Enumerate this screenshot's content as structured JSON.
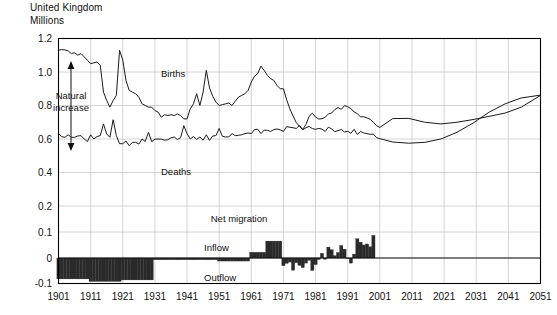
{
  "header": {
    "title": "United Kingdom",
    "units": "Millions"
  },
  "annotations": {
    "natural_increase_line1": "Natural",
    "natural_increase_line2": "increase",
    "births": "Births",
    "deaths": "Deaths",
    "net_migration": "Net migration",
    "inflow": "Inflow",
    "outflow": "Outflow"
  },
  "colors": {
    "line": "#1a1a1a",
    "grid": "#c9c9c9",
    "axis": "#000000",
    "bar": "#2a2a2a",
    "background": "#ffffff"
  },
  "chart_data": {
    "type": "line",
    "title": "United Kingdom",
    "subtitle": "Millions",
    "xlabel": "",
    "ylabel": "Millions",
    "xlim": [
      1901,
      2051
    ],
    "ylim": [
      -0.1,
      1.2
    ],
    "grid": true,
    "legend": "inline-labels",
    "yticks": [
      -0.1,
      0,
      0.1,
      0.2,
      0.4,
      0.6,
      0.8,
      1.0,
      1.2
    ],
    "ytick_labels": [
      "-0.1",
      "0",
      "0.1",
      "0.2",
      "0.4",
      "0.6",
      "0.8",
      "1.0",
      "1.2"
    ],
    "y_axis_note": "non-linear: region below 0.2 is expanded for the migration bars",
    "xticks": [
      1901,
      1911,
      1921,
      1931,
      1941,
      1951,
      1961,
      1971,
      1981,
      1991,
      2001,
      2011,
      2021,
      2031,
      2041,
      2051
    ],
    "xtick_labels": [
      "1901",
      "1911",
      "1921",
      "1931",
      "1941",
      "1951",
      "1961",
      "1971",
      "1981",
      "1991",
      "2001",
      "2011",
      "2021",
      "2031",
      "2041",
      "2051"
    ],
    "series": [
      {
        "name": "Births",
        "x": [
          1901,
          1902,
          1903,
          1904,
          1905,
          1906,
          1907,
          1908,
          1909,
          1910,
          1911,
          1912,
          1913,
          1914,
          1915,
          1916,
          1917,
          1918,
          1919,
          1920,
          1921,
          1922,
          1923,
          1924,
          1925,
          1926,
          1927,
          1928,
          1929,
          1930,
          1931,
          1932,
          1933,
          1934,
          1935,
          1936,
          1937,
          1938,
          1939,
          1940,
          1941,
          1942,
          1943,
          1944,
          1945,
          1946,
          1947,
          1948,
          1949,
          1950,
          1951,
          1952,
          1953,
          1954,
          1955,
          1956,
          1957,
          1958,
          1959,
          1960,
          1961,
          1962,
          1963,
          1964,
          1965,
          1966,
          1967,
          1968,
          1969,
          1970,
          1971,
          1972,
          1973,
          1974,
          1975,
          1976,
          1977,
          1978,
          1979,
          1980,
          1981,
          1982,
          1983,
          1984,
          1985,
          1986,
          1987,
          1988,
          1989,
          1990,
          1991,
          1992,
          1993,
          1994,
          1995,
          1996,
          1997,
          1998,
          1999,
          2000,
          2001,
          2005,
          2010,
          2015,
          2020,
          2025,
          2030,
          2035,
          2040,
          2045,
          2051
        ],
        "values": [
          1.13,
          1.134,
          1.132,
          1.126,
          1.11,
          1.115,
          1.1,
          1.11,
          1.09,
          1.07,
          1.05,
          1.055,
          1.06,
          1.04,
          0.88,
          0.83,
          0.79,
          0.83,
          0.86,
          1.13,
          1.07,
          0.95,
          0.89,
          0.88,
          0.87,
          0.85,
          0.81,
          0.8,
          0.79,
          0.79,
          0.77,
          0.76,
          0.73,
          0.745,
          0.74,
          0.745,
          0.74,
          0.75,
          0.74,
          0.72,
          0.72,
          0.78,
          0.81,
          0.87,
          0.8,
          0.88,
          1.01,
          0.905,
          0.855,
          0.82,
          0.8,
          0.805,
          0.81,
          0.815,
          0.8,
          0.825,
          0.85,
          0.86,
          0.87,
          0.89,
          0.94,
          0.975,
          0.99,
          1.035,
          1.01,
          0.98,
          0.96,
          0.95,
          0.92,
          0.9,
          0.9,
          0.834,
          0.78,
          0.737,
          0.698,
          0.675,
          0.657,
          0.687,
          0.735,
          0.754,
          0.731,
          0.719,
          0.721,
          0.73,
          0.75,
          0.755,
          0.776,
          0.788,
          0.777,
          0.799,
          0.793,
          0.781,
          0.762,
          0.751,
          0.732,
          0.733,
          0.726,
          0.717,
          0.7,
          0.679,
          0.669,
          0.722,
          0.723,
          0.7,
          0.69,
          0.7,
          0.716,
          0.735,
          0.755,
          0.79,
          0.86
        ]
      },
      {
        "name": "Deaths",
        "x": [
          1901,
          1902,
          1903,
          1904,
          1905,
          1906,
          1907,
          1908,
          1909,
          1910,
          1911,
          1912,
          1913,
          1914,
          1915,
          1916,
          1917,
          1918,
          1919,
          1920,
          1921,
          1922,
          1923,
          1924,
          1925,
          1926,
          1927,
          1928,
          1929,
          1930,
          1931,
          1932,
          1933,
          1934,
          1935,
          1936,
          1937,
          1938,
          1939,
          1940,
          1941,
          1942,
          1943,
          1944,
          1945,
          1946,
          1947,
          1948,
          1949,
          1950,
          1951,
          1952,
          1953,
          1954,
          1955,
          1956,
          1957,
          1958,
          1959,
          1960,
          1961,
          1962,
          1963,
          1964,
          1965,
          1966,
          1967,
          1968,
          1969,
          1970,
          1971,
          1972,
          1973,
          1974,
          1975,
          1976,
          1977,
          1978,
          1979,
          1980,
          1981,
          1982,
          1983,
          1984,
          1985,
          1986,
          1987,
          1988,
          1989,
          1990,
          1991,
          1992,
          1993,
          1994,
          1995,
          1996,
          1997,
          1998,
          1999,
          2000,
          2001,
          2005,
          2010,
          2015,
          2020,
          2025,
          2030,
          2035,
          2040,
          2045,
          2051
        ],
        "values": [
          0.632,
          0.614,
          0.61,
          0.625,
          0.61,
          0.61,
          0.618,
          0.62,
          0.6,
          0.585,
          0.625,
          0.6,
          0.615,
          0.62,
          0.69,
          0.63,
          0.61,
          0.715,
          0.62,
          0.572,
          0.572,
          0.588,
          0.56,
          0.58,
          0.58,
          0.57,
          0.6,
          0.585,
          0.64,
          0.584,
          0.599,
          0.6,
          0.599,
          0.593,
          0.595,
          0.607,
          0.612,
          0.597,
          0.608,
          0.68,
          0.632,
          0.6,
          0.615,
          0.598,
          0.612,
          0.593,
          0.625,
          0.592,
          0.618,
          0.62,
          0.663,
          0.616,
          0.612,
          0.613,
          0.632,
          0.62,
          0.622,
          0.625,
          0.632,
          0.636,
          0.632,
          0.656,
          0.658,
          0.632,
          0.653,
          0.652,
          0.645,
          0.656,
          0.66,
          0.655,
          0.645,
          0.674,
          0.67,
          0.667,
          0.663,
          0.681,
          0.655,
          0.667,
          0.675,
          0.662,
          0.658,
          0.663,
          0.659,
          0.645,
          0.671,
          0.66,
          0.644,
          0.65,
          0.657,
          0.642,
          0.646,
          0.634,
          0.658,
          0.627,
          0.645,
          0.636,
          0.632,
          0.628,
          0.629,
          0.608,
          0.602,
          0.582,
          0.575,
          0.58,
          0.6,
          0.64,
          0.695,
          0.76,
          0.81,
          0.845,
          0.862
        ]
      }
    ],
    "net_migration": {
      "type": "bar",
      "name": "Net migration",
      "positive_label": "Inflow",
      "negative_label": "Outflow",
      "x": [
        1901,
        1902,
        1903,
        1904,
        1905,
        1906,
        1907,
        1908,
        1909,
        1910,
        1911,
        1912,
        1913,
        1914,
        1915,
        1916,
        1917,
        1918,
        1919,
        1920,
        1921,
        1922,
        1923,
        1924,
        1925,
        1926,
        1927,
        1928,
        1929,
        1930,
        1931,
        1932,
        1933,
        1934,
        1935,
        1936,
        1937,
        1938,
        1939,
        1940,
        1941,
        1942,
        1943,
        1944,
        1945,
        1946,
        1947,
        1948,
        1949,
        1950,
        1951,
        1952,
        1953,
        1954,
        1955,
        1956,
        1957,
        1958,
        1959,
        1960,
        1961,
        1962,
        1963,
        1964,
        1965,
        1966,
        1967,
        1968,
        1969,
        1970,
        1971,
        1972,
        1973,
        1974,
        1975,
        1976,
        1977,
        1978,
        1979,
        1980,
        1981,
        1982,
        1983,
        1984,
        1985,
        1986,
        1987,
        1988,
        1989,
        1990,
        1991,
        1992,
        1993,
        1994,
        1995,
        1996,
        1997,
        1998,
        1999
      ],
      "values": [
        -0.082,
        -0.082,
        -0.082,
        -0.082,
        -0.082,
        -0.082,
        -0.082,
        -0.082,
        -0.082,
        -0.082,
        -0.092,
        -0.092,
        -0.092,
        -0.092,
        -0.092,
        -0.092,
        -0.092,
        -0.092,
        -0.092,
        -0.092,
        -0.086,
        -0.086,
        -0.086,
        -0.086,
        -0.086,
        -0.086,
        -0.086,
        -0.086,
        -0.086,
        -0.086,
        -0.007,
        -0.007,
        -0.007,
        -0.007,
        -0.007,
        -0.007,
        -0.007,
        -0.007,
        -0.007,
        -0.007,
        -0.007,
        -0.007,
        -0.007,
        -0.007,
        -0.007,
        -0.007,
        -0.007,
        -0.007,
        -0.007,
        -0.007,
        -0.012,
        -0.012,
        -0.012,
        -0.012,
        -0.012,
        -0.012,
        -0.012,
        -0.012,
        -0.012,
        -0.012,
        0.022,
        0.022,
        0.022,
        0.022,
        0.022,
        0.065,
        0.065,
        0.065,
        0.065,
        0.065,
        -0.03,
        -0.021,
        -0.016,
        -0.048,
        -0.018,
        -0.029,
        -0.038,
        -0.02,
        -0.009,
        -0.049,
        -0.026,
        -0.006,
        0.018,
        -0.005,
        0.042,
        0.032,
        0.009,
        0.021,
        0.048,
        0.034,
        -0.002,
        -0.02,
        0.015,
        0.074,
        0.061,
        0.05,
        0.054,
        0.043,
        0.087,
        0.06,
        0.06,
        0.09
      ]
    }
  }
}
